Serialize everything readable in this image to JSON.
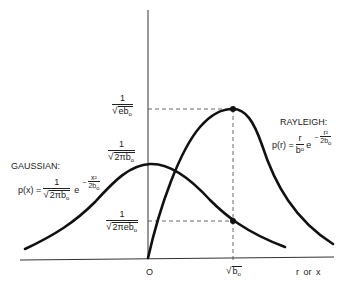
{
  "diagram": {
    "type": "probability-density-comparison",
    "curves": [
      {
        "name": "Gaussian",
        "label": "GAUSSIAN:",
        "formula": {
          "lhs": "p(x) =",
          "coef_num": "1",
          "coef_den": "2πb",
          "coef_den_sub": "o",
          "base": "e",
          "exp_sign": "−",
          "exp_num": "x²",
          "exp_den": "2b",
          "exp_den_sub": "o"
        },
        "peak_label": {
          "num": "1",
          "den": "2πb",
          "sub": "o"
        },
        "marker_label": {
          "num": "1",
          "den": "2πeb",
          "sub": "o"
        }
      },
      {
        "name": "Rayleigh",
        "label": "RAYLEIGH:",
        "formula": {
          "lhs": "p(r) =",
          "coef_num": "r",
          "coef_den": "b",
          "coef_den_sub": "o",
          "base": "e",
          "exp_sign": "−",
          "exp_num": "r²",
          "exp_den": "2b",
          "exp_den_sub": "o"
        },
        "peak_label": {
          "num": "1",
          "den": "eb",
          "sub": "o"
        }
      }
    ],
    "axes": {
      "origin_label": "O",
      "x_tick_label": "b",
      "x_tick_sub": "o",
      "x_axis_label": "r  or  x"
    },
    "colors": {
      "curve": "#111111",
      "axis": "#333333",
      "dashed": "#444444",
      "background": "#ffffff"
    }
  }
}
